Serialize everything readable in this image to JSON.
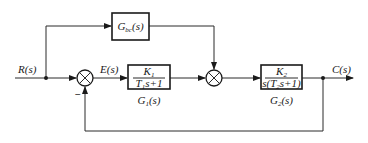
{
  "diagram": {
    "type": "control-system-block-diagram",
    "signals": {
      "input": "R(s)",
      "error": "E(s)",
      "output": "C(s)"
    },
    "feedback_sign": "−",
    "blocks": {
      "feedforward": {
        "name_main": "G",
        "name_sub": "bc",
        "name_tail": "(s)"
      },
      "g1": {
        "num_main": "K",
        "num_sub": "1",
        "den_pre": "T",
        "den_sub": "1",
        "den_post": "s+1",
        "name_main": "G",
        "name_sub": "1",
        "name_tail": "(s)"
      },
      "g2": {
        "num_main": "K",
        "num_sub": "2",
        "den_pre": "s(T",
        "den_sub": "2",
        "den_post": "s+1)",
        "name_main": "G",
        "name_sub": "2",
        "name_tail": "(s)"
      }
    }
  }
}
